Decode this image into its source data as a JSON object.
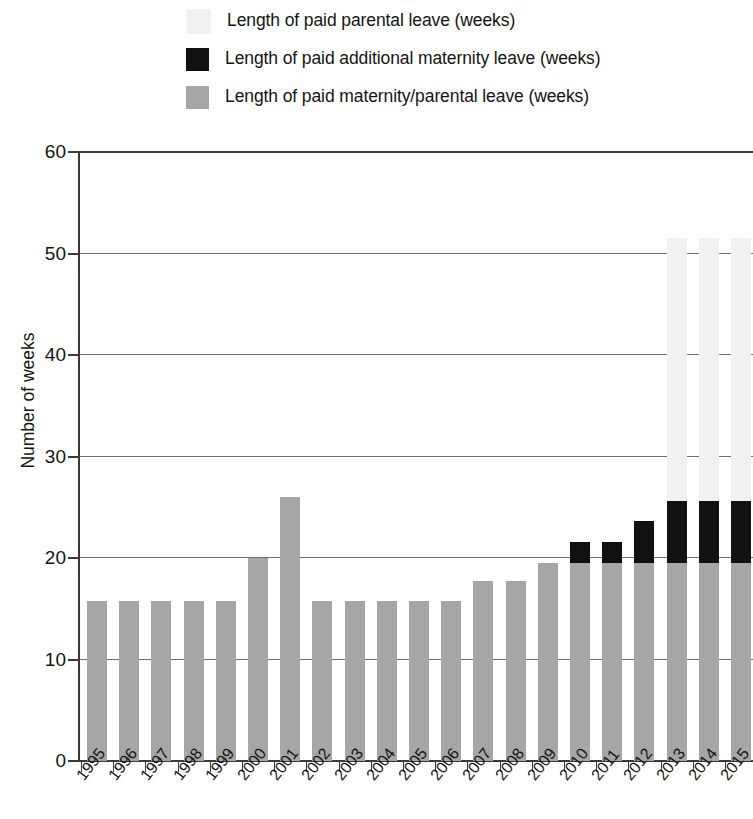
{
  "legend": {
    "position": "top",
    "items": [
      {
        "label": "Length of paid parental leave (weeks)",
        "color": "#f0f0f0",
        "key": "parental"
      },
      {
        "label": "Length of paid additional maternity leave (weeks)",
        "color": "#111111",
        "key": "additional_maternity"
      },
      {
        "label": "Length of paid maternity/parental leave (weeks)",
        "color": "#a6a6a6",
        "key": "maternity_parental"
      }
    ]
  },
  "axes": {
    "y_title": "Number of weeks",
    "y_ticks": [
      "0",
      "10",
      "20",
      "30",
      "40",
      "50",
      "60"
    ]
  },
  "chart_data": {
    "type": "bar",
    "title": "",
    "subtitle": "",
    "stacked": true,
    "xlabel": "",
    "ylabel": "Number of weeks",
    "ylim": [
      0,
      60
    ],
    "ytick_step": 10,
    "grid": true,
    "legend_position": "top",
    "categories": [
      "1995",
      "1996",
      "1997",
      "1998",
      "1999",
      "2000",
      "2001",
      "2002",
      "2003",
      "2004",
      "2005",
      "2006",
      "2007",
      "2008",
      "2009",
      "2010",
      "2011",
      "2012",
      "2013",
      "2014",
      "2015"
    ],
    "series": [
      {
        "name": "Length of paid maternity/parental leave (weeks)",
        "color": "#a6a6a6",
        "values": [
          15.8,
          15.8,
          15.8,
          15.8,
          15.8,
          20.0,
          26.0,
          15.8,
          15.8,
          15.8,
          15.8,
          15.8,
          17.7,
          17.7,
          19.5,
          19.5,
          19.5,
          19.5,
          19.5,
          19.5,
          19.5
        ]
      },
      {
        "name": "Length of paid additional maternity leave (weeks)",
        "color": "#111111",
        "values": [
          0,
          0,
          0,
          0,
          0,
          0,
          0,
          0,
          0,
          0,
          0,
          0,
          0,
          0,
          0,
          2.1,
          2.1,
          4.1,
          6.1,
          6.1,
          6.1
        ]
      },
      {
        "name": "Length of paid parental leave (weeks)",
        "color": "#f0f0f0",
        "values": [
          0,
          0,
          0,
          0,
          0,
          0,
          0,
          0,
          0,
          0,
          0,
          0,
          0,
          0,
          0,
          0,
          0,
          0,
          25.9,
          25.9,
          25.9
        ]
      }
    ],
    "totals": [
      15.8,
      15.8,
      15.8,
      15.8,
      15.8,
      20.0,
      26.0,
      15.8,
      15.8,
      15.8,
      15.8,
      15.8,
      17.7,
      17.7,
      19.5,
      21.6,
      21.6,
      23.6,
      51.5,
      51.5,
      51.5
    ]
  }
}
